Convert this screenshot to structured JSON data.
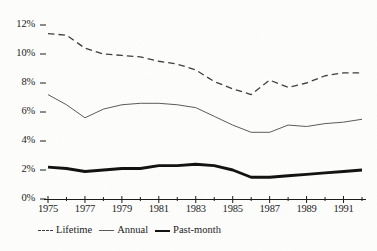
{
  "chart_data": {
    "type": "line",
    "title": "",
    "subtitle": "",
    "xlabel": "",
    "ylabel": "",
    "xlim": [
      1975,
      1992
    ],
    "ylim": [
      0,
      12
    ],
    "grid": false,
    "legend_position": "bottom-left",
    "x": [
      1975,
      1976,
      1977,
      1978,
      1979,
      1980,
      1981,
      1982,
      1983,
      1984,
      1985,
      1986,
      1987,
      1988,
      1989,
      1990,
      1991,
      1992
    ],
    "x_tick_labels": [
      "1975",
      "1977",
      "1979",
      "1981",
      "1983",
      "1985",
      "1987",
      "1989",
      "1991"
    ],
    "x_tick_values": [
      1975,
      1977,
      1979,
      1981,
      1983,
      1985,
      1987,
      1989,
      1991
    ],
    "x_minor_ticks": [
      1976,
      1978,
      1980,
      1982,
      1984,
      1986,
      1988,
      1990,
      1992
    ],
    "y_tick_labels": [
      "0%",
      "2%",
      "4%",
      "6%",
      "8%",
      "10%",
      "12%"
    ],
    "y_tick_values": [
      0,
      2,
      4,
      6,
      8,
      10,
      12
    ],
    "series": [
      {
        "name": "Lifetime",
        "style": "dashed",
        "color": "#3d3d3d",
        "width": 1.3,
        "values": [
          11.4,
          11.3,
          10.4,
          10.0,
          9.9,
          9.8,
          9.5,
          9.3,
          8.9,
          8.1,
          7.6,
          7.2,
          8.2,
          7.7,
          8.0,
          8.5,
          8.7,
          8.7
        ]
      },
      {
        "name": "Annual",
        "style": "solid-thin",
        "color": "#5a5a5a",
        "width": 1.0,
        "values": [
          7.2,
          6.5,
          5.6,
          6.2,
          6.5,
          6.6,
          6.6,
          6.5,
          6.3,
          5.7,
          5.1,
          4.6,
          4.6,
          5.1,
          5.0,
          5.2,
          5.3,
          5.5
        ]
      },
      {
        "name": "Past-month",
        "style": "solid-thick",
        "color": "#111111",
        "width": 2.9,
        "values": [
          2.2,
          2.1,
          1.9,
          2.0,
          2.1,
          2.1,
          2.3,
          2.3,
          2.4,
          2.3,
          2.0,
          1.5,
          1.5,
          1.6,
          1.7,
          1.8,
          1.9,
          2.0
        ]
      }
    ],
    "legend_entries": [
      {
        "label": "Lifetime",
        "style": "dashed"
      },
      {
        "label": "Annual",
        "style": "solid-thin"
      },
      {
        "label": "Past-month",
        "style": "solid-thick"
      }
    ],
    "colors": {
      "background": "#fdfdfb",
      "axis": "#1b1b1b",
      "lifetime": "#3d3d3d",
      "annual": "#5a5a5a",
      "pastmonth": "#111111"
    }
  }
}
